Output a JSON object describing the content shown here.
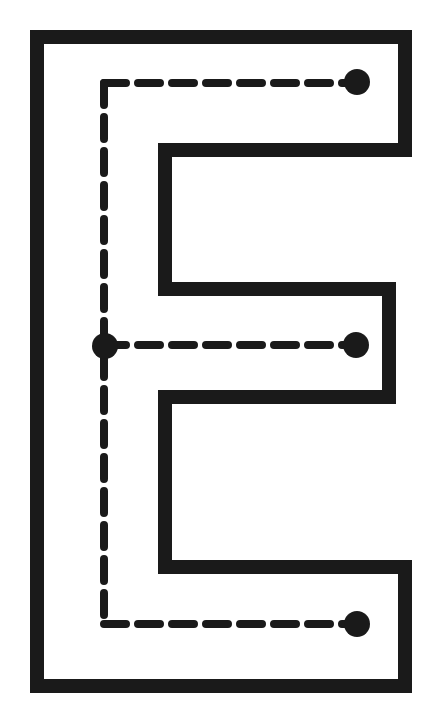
{
  "worksheet": {
    "type": "letter-tracing-worksheet",
    "letter": "E",
    "letter_case": "uppercase",
    "title": "",
    "background_color": "#ffffff",
    "ink_color": "#1a1a1a"
  },
  "canvas": {
    "width": 443,
    "height": 719
  },
  "letter_outline": {
    "name": "uppercase-E-outline",
    "stroke_color": "#1a1a1a",
    "stroke_width": 14,
    "fill": "none",
    "path": "M 37 37 L 405 37 L 405 150 L 165 150 L 165 289 L 389 289 L 389 397 L 165 397 L 165 567 L 405 567 L 405 686 L 37 686 Z"
  },
  "trace_guides": {
    "stroke_color": "#1a1a1a",
    "stroke_width": 8,
    "dash_pattern": "22 12",
    "strokes": [
      {
        "name": "stroke-1-top-horizontal",
        "order": 1,
        "direction": "left-to-right",
        "from": [
          104,
          83
        ],
        "to": [
          348,
          83
        ]
      },
      {
        "name": "stroke-2-vertical-stem",
        "order": 2,
        "direction": "top-to-bottom",
        "from": [
          104,
          83
        ],
        "to": [
          104,
          624
        ]
      },
      {
        "name": "stroke-3-middle-horizontal",
        "order": 3,
        "direction": "left-to-right",
        "from": [
          104,
          345
        ],
        "to": [
          347,
          345
        ]
      },
      {
        "name": "stroke-4-bottom-horizontal",
        "order": 4,
        "direction": "left-to-right",
        "from": [
          104,
          624
        ],
        "to": [
          348,
          624
        ]
      }
    ]
  },
  "endpoint_dots": {
    "fill_color": "#1a1a1a",
    "radius": 13,
    "dots": [
      {
        "name": "dot-top-right-end",
        "cx": 357,
        "cy": 82,
        "label": "top stroke end"
      },
      {
        "name": "dot-middle-left-junction",
        "cx": 105,
        "cy": 346,
        "label": "middle stroke start"
      },
      {
        "name": "dot-middle-right-end",
        "cx": 356,
        "cy": 345,
        "label": "middle stroke end"
      },
      {
        "name": "dot-bottom-right-end",
        "cx": 357,
        "cy": 624,
        "label": "bottom stroke end"
      }
    ]
  }
}
